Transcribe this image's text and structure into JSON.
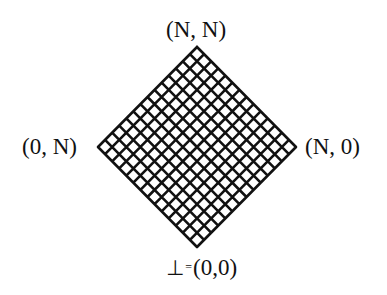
{
  "diagram": {
    "type": "lattice",
    "shape": "diamond-grid",
    "grid_cells_per_side": 14,
    "stroke_color": "#111111",
    "background_color": "#ffffff",
    "vertices": {
      "top": {
        "label": "(N, N)"
      },
      "left": {
        "label": "(0, N)"
      },
      "right": {
        "label": "(N, 0)"
      },
      "bottom": {
        "symbol": "⊥",
        "equals": "=",
        "label": "(0,0)"
      }
    }
  }
}
